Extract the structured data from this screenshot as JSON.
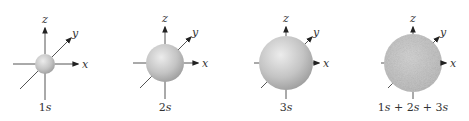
{
  "figure": {
    "axes_labels": {
      "x": "x",
      "y": "y",
      "z": "z"
    },
    "panels": [
      {
        "id": "1s",
        "caption_num": "1",
        "caption_orb": "s",
        "cx": 45,
        "cy": 64,
        "r": 10,
        "style": "shaded"
      },
      {
        "id": "2s",
        "caption_num": "2",
        "caption_orb": "s",
        "cx": 165,
        "cy": 63,
        "r": 19,
        "style": "shaded"
      },
      {
        "id": "3s",
        "caption_num": "3",
        "caption_orb": "s",
        "cx": 286,
        "cy": 63,
        "r": 27,
        "style": "shaded"
      },
      {
        "id": "sum",
        "caption": "1s + 2s + 3s",
        "cx": 413,
        "cy": 63,
        "r": 29,
        "style": "stippled"
      }
    ],
    "colors": {
      "axis": "#555555",
      "sphere_light": "#e6e6e6",
      "sphere_dark": "#9a9a9a",
      "stipple": "#b0b0b0"
    }
  }
}
